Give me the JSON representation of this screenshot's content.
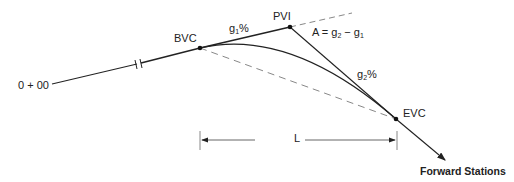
{
  "diagram": {
    "type": "vertical-curve",
    "labels": {
      "start_station": "0 + 00",
      "bvc": "BVC",
      "pvi": "PVI",
      "evc": "EVC",
      "g1": "g",
      "g1_sub": "1",
      "g1_suffix": "%",
      "g2": "g",
      "g2_sub": "2",
      "g2_suffix": "%",
      "a_eq_prefix": "A = g",
      "a_eq_sub1": "2",
      "a_eq_mid": " − g",
      "a_eq_sub2": "1",
      "length": "L",
      "forward": "Forward Stations"
    },
    "points": {
      "start": [
        52,
        84
      ],
      "break": [
        138,
        64
      ],
      "bvc": [
        200,
        48
      ],
      "pvi": [
        290,
        27
      ],
      "pvi_ext": [
        352,
        13
      ],
      "evc": [
        396,
        119
      ],
      "end": [
        445,
        160
      ]
    },
    "colors": {
      "line": "#222222",
      "dashed": "#888888"
    }
  }
}
